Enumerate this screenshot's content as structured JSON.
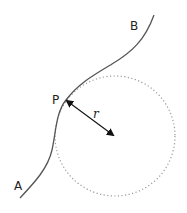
{
  "diagram": {
    "type": "osculating-circle",
    "labels": {
      "start_point": "A",
      "end_point": "B",
      "contact_point": "P",
      "radius": "r"
    },
    "colors": {
      "curve": "#555555",
      "circle": "#999999",
      "arrow": "#111111",
      "text": "#222222"
    },
    "circle": {
      "cx": 115,
      "cy": 136,
      "r": 60,
      "style": "dotted"
    }
  }
}
